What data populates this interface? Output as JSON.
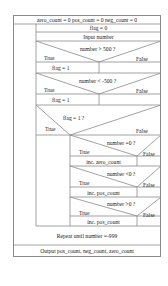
{
  "diagram": {
    "type": "nassi-shneiderman",
    "init": "zero_count = 0   pos_count = 0   neg_count = 0",
    "loop_body": {
      "flag_init": "flag = 0",
      "input": "Input number",
      "cond1": {
        "text": "number > 500 ?",
        "true": "True",
        "false": "False",
        "true_action": "flag = 1"
      },
      "cond2": {
        "text": "number < -500 ?",
        "true": "True",
        "false": "False",
        "true_action": "flag = 1"
      },
      "cond3": {
        "text": "flag = 1 ?",
        "true": "True",
        "false": "False",
        "nested": [
          {
            "text": "number =0 ?",
            "true": "True",
            "false": "False",
            "action": "inc. zero_count"
          },
          {
            "text": "number <0 ?",
            "true": "True",
            "false": "False",
            "action": "inc. neg_count"
          },
          {
            "text": "number >0 ?",
            "true": "True",
            "false": "False",
            "action": "inc. pos_count"
          }
        ]
      }
    },
    "repeat": "Repeat until number =-999",
    "output": "Output pos_count, neg_count, zero_count"
  }
}
